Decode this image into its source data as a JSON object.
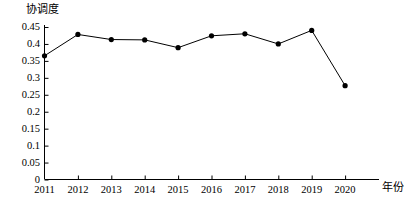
{
  "chart_data": {
    "type": "line",
    "title": "",
    "xlabel": "年份",
    "ylabel": "协调度",
    "categories": [
      "2011",
      "2012",
      "2013",
      "2014",
      "2015",
      "2016",
      "2017",
      "2018",
      "2019",
      "2020"
    ],
    "values": [
      0.365,
      0.428,
      0.413,
      0.412,
      0.389,
      0.424,
      0.43,
      0.4,
      0.44,
      0.277
    ],
    "series": [
      {
        "name": "协调度",
        "values": [
          0.365,
          0.428,
          0.413,
          0.412,
          0.389,
          0.424,
          0.43,
          0.4,
          0.44,
          0.277
        ]
      }
    ],
    "ylim": [
      0,
      0.45
    ],
    "yticks": [
      0,
      0.05,
      0.1,
      0.15,
      0.2,
      0.25,
      0.3,
      0.35,
      0.4,
      0.45
    ],
    "ytick_labels": [
      "0",
      "0.05",
      "0.1",
      "0.15",
      "0.2",
      "0.25",
      "0.3",
      "0.35",
      "0.4",
      "0.45"
    ],
    "xtick_labels": [
      "2011",
      "2012",
      "2013",
      "2014",
      "2015",
      "2016",
      "2017",
      "2018",
      "2019",
      "2020"
    ],
    "grid": false,
    "legend": false,
    "legend_position": "none",
    "marker": "filled-circle",
    "line_color": "#000000",
    "marker_color": "#000000",
    "axis_color": "#000000",
    "background_color": "#ffffff"
  },
  "axes": {
    "y_title": "协调度",
    "x_title": "年份"
  }
}
